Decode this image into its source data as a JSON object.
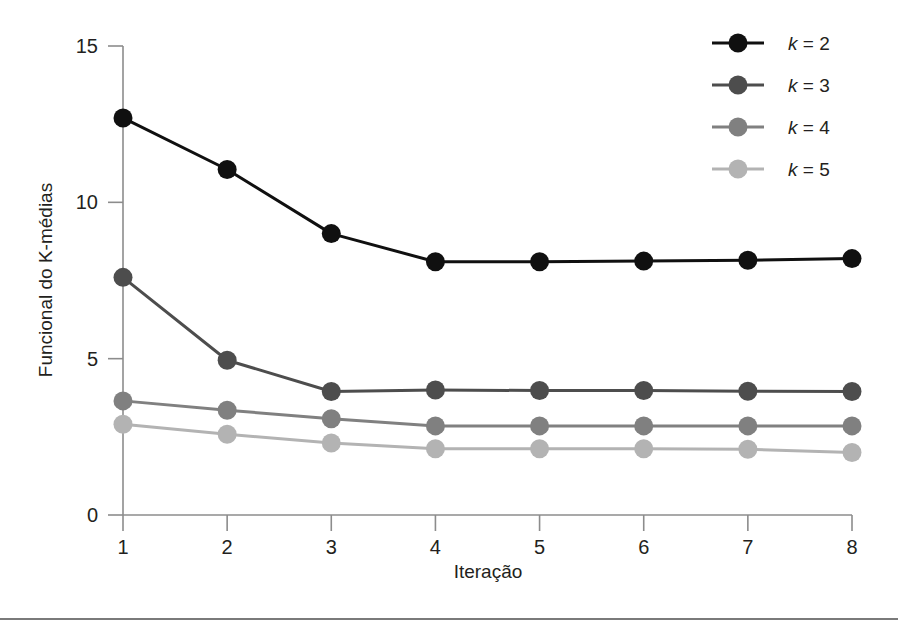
{
  "chart_data": {
    "type": "line",
    "title": "",
    "xlabel": "Iteração",
    "ylabel": "Funcional do K-médias",
    "x": [
      1,
      2,
      3,
      4,
      5,
      6,
      7,
      8
    ],
    "xtick_labels": [
      "1",
      "2",
      "3",
      "4",
      "5",
      "6",
      "7",
      "8"
    ],
    "ytick_values": [
      0,
      5,
      10,
      15
    ],
    "ytick_labels": [
      "0",
      "5",
      "10",
      "15"
    ],
    "xlim": [
      1,
      8
    ],
    "ylim": [
      0,
      15
    ],
    "grid": false,
    "legend_position": "top-right",
    "series": [
      {
        "name": "k = 2",
        "legend_prefix": "k",
        "legend_suffix": "= 2",
        "color": "#101010",
        "values": [
          12.7,
          11.05,
          9.0,
          8.1,
          8.1,
          8.12,
          8.15,
          8.2
        ]
      },
      {
        "name": "k = 3",
        "legend_prefix": "k",
        "legend_suffix": "= 3",
        "color": "#4d4d4d",
        "values": [
          7.6,
          4.95,
          3.95,
          4.0,
          3.98,
          3.98,
          3.96,
          3.95
        ]
      },
      {
        "name": "k = 4",
        "legend_prefix": "k",
        "legend_suffix": "= 4",
        "color": "#808080",
        "values": [
          3.65,
          3.35,
          3.08,
          2.85,
          2.85,
          2.85,
          2.85,
          2.85
        ]
      },
      {
        "name": "k = 5",
        "legend_prefix": "k",
        "legend_suffix": "= 5",
        "color": "#b3b3b3",
        "values": [
          2.9,
          2.58,
          2.3,
          2.12,
          2.12,
          2.12,
          2.1,
          2.0
        ]
      }
    ]
  },
  "figure": {
    "background_color": "#ffffff",
    "axis_color": "#8c8c8c",
    "text_color": "#231f20"
  }
}
